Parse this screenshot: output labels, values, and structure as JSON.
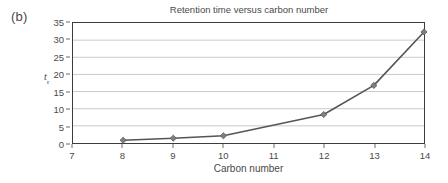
{
  "figure": {
    "panel_label": "(b)"
  },
  "chart_data": {
    "type": "line",
    "title": "Retention time versus carbon number",
    "xlabel": "Carbon number",
    "ylabel": "t",
    "ylabel_subscript": "r",
    "x": [
      8,
      9,
      10,
      12,
      13,
      14
    ],
    "values": [
      0.8,
      1.4,
      2.1,
      8.3,
      16.8,
      32.4
    ],
    "xlim": [
      7,
      14
    ],
    "ylim": [
      0,
      35
    ],
    "xticks": [
      "7",
      "8",
      "9",
      "10",
      "11",
      "12",
      "13",
      "14"
    ],
    "yticks": [
      "0",
      "5",
      "10",
      "15",
      "20",
      "25",
      "30",
      "35"
    ],
    "grid": "horizontal",
    "legend": "none",
    "marker": "diamond",
    "series_color": "#555555",
    "marker_color": "#808080",
    "grid_color": "#c9c9c9",
    "axis_color": "#3c3c3c"
  }
}
